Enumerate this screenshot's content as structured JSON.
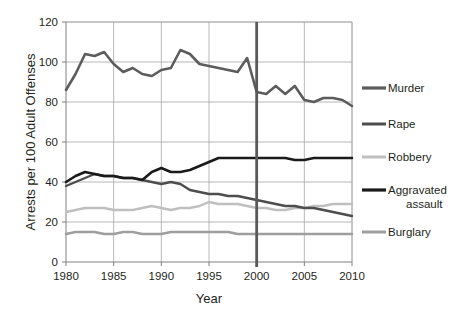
{
  "chart_data": {
    "type": "line",
    "title": "",
    "xlabel": "Year",
    "ylabel": "Arrests per 100 Adult Offenses",
    "xlim": [
      1980,
      2010
    ],
    "ylim": [
      0,
      120
    ],
    "xticks": [
      1980,
      1985,
      1990,
      1995,
      2000,
      2005,
      2010
    ],
    "xtick_labels": [
      "1980",
      "1985",
      "1990",
      "1995",
      "2000",
      "2005",
      "2010"
    ],
    "yticks": [
      0,
      20,
      40,
      60,
      80,
      100,
      120
    ],
    "ytick_labels": [
      "0",
      "20",
      "40",
      "60",
      "80",
      "100",
      "120"
    ],
    "grid": "horizontal-and-vertical",
    "legend_position": "right",
    "x": [
      1980,
      1981,
      1982,
      1983,
      1984,
      1985,
      1986,
      1987,
      1988,
      1989,
      1990,
      1991,
      1992,
      1993,
      1994,
      1995,
      1996,
      1997,
      1998,
      1999,
      2000,
      2001,
      2002,
      2003,
      2004,
      2005,
      2006,
      2007,
      2008,
      2009,
      2010
    ],
    "series": [
      {
        "name": "Murder",
        "color": "#5c5c5c",
        "values": [
          86,
          94,
          104,
          103,
          105,
          99,
          95,
          97,
          94,
          93,
          96,
          97,
          106,
          104,
          99,
          98,
          97,
          96,
          95,
          102,
          85,
          84,
          88,
          84,
          88,
          81,
          80,
          82,
          82,
          81,
          78
        ]
      },
      {
        "name": "Rape",
        "color": "#4d4d4d",
        "values": [
          38,
          40,
          42,
          44,
          43,
          43,
          42,
          42,
          41,
          40,
          39,
          40,
          39,
          36,
          35,
          34,
          34,
          33,
          33,
          32,
          31,
          30,
          29,
          28,
          28,
          27,
          27,
          26,
          25,
          24,
          23
        ]
      },
      {
        "name": "Robbery",
        "color": "#bfbfbf",
        "values": [
          25,
          26,
          27,
          27,
          27,
          26,
          26,
          26,
          27,
          28,
          27,
          26,
          27,
          27,
          28,
          30,
          29,
          29,
          29,
          28,
          27,
          27,
          26,
          26,
          27,
          27,
          28,
          28,
          29,
          29,
          29
        ]
      },
      {
        "name": "Aggravated assault",
        "color": "#1a1a1a",
        "values": [
          40,
          43,
          45,
          44,
          43,
          43,
          42,
          42,
          41,
          45,
          47,
          45,
          45,
          46,
          48,
          50,
          52,
          52,
          52,
          52,
          52,
          52,
          52,
          52,
          51,
          51,
          52,
          52,
          52,
          52,
          52
        ]
      },
      {
        "name": "Burglary",
        "color": "#9e9e9e",
        "values": [
          14,
          15,
          15,
          15,
          14,
          14,
          15,
          15,
          14,
          14,
          14,
          15,
          15,
          15,
          15,
          15,
          15,
          15,
          14,
          14,
          14,
          14,
          14,
          14,
          14,
          14,
          14,
          14,
          14,
          14,
          14
        ]
      }
    ],
    "annotations": [
      {
        "type": "vertical-marker",
        "x": 2000,
        "color": "#595959",
        "label": ""
      }
    ]
  },
  "legend": {
    "entries": [
      {
        "label": "Murder",
        "label2": ""
      },
      {
        "label": "Rape",
        "label2": ""
      },
      {
        "label": "Robbery",
        "label2": ""
      },
      {
        "label": "Aggravated",
        "label2": "assault"
      },
      {
        "label": "Burglary",
        "label2": ""
      }
    ]
  },
  "colors": {
    "background": "#ffffff",
    "grid": "#a6a6a6",
    "axis": "#808080",
    "text": "#231f20",
    "marker": "#595959"
  }
}
